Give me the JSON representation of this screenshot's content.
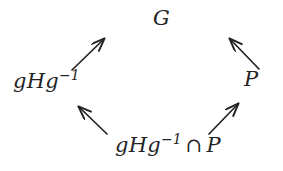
{
  "diagram": {
    "type": "commutative-lattice-diagram",
    "background_color": "#ffffff",
    "ink_color": "#232323",
    "nodes": {
      "top": {
        "id": "G",
        "base": "G",
        "text": "G"
      },
      "left": {
        "id": "gHg-inverse",
        "base": "gHg",
        "exponent": "−1",
        "text": "gHg⁻¹"
      },
      "right": {
        "id": "P",
        "base": "P",
        "text": "P"
      },
      "bottom": {
        "id": "gHg-inverse-cap-P",
        "base": "gHg",
        "exponent": "−1",
        "operator": "∩",
        "tail": "P",
        "text": "gHg⁻¹ ∩ P"
      }
    },
    "edges": [
      {
        "id": "edge-left-to-top",
        "from": "gHg-inverse",
        "to": "G",
        "direction": "up-right",
        "x1": 72,
        "y1": 70,
        "x2": 106,
        "y2": 37
      },
      {
        "id": "edge-right-to-top",
        "from": "P",
        "to": "G",
        "direction": "up-left",
        "x1": 259,
        "y1": 69,
        "x2": 228,
        "y2": 37
      },
      {
        "id": "edge-bottom-to-left",
        "from": "gHg-inverse-cap-P",
        "to": "gHg-inverse",
        "direction": "up-left",
        "x1": 107,
        "y1": 134,
        "x2": 77,
        "y2": 105
      },
      {
        "id": "edge-bottom-to-right",
        "from": "gHg-inverse-cap-P",
        "to": "P",
        "direction": "up-right",
        "x1": 209,
        "y1": 134,
        "x2": 240,
        "y2": 102
      }
    ]
  }
}
